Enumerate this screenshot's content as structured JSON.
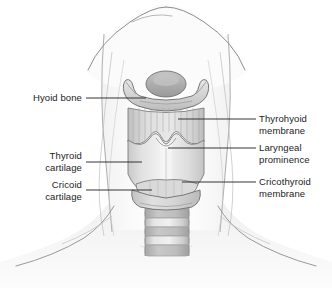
{
  "figure": {
    "background_color": "#ffffff",
    "line_color": "#2a2a2a",
    "label_text_color": "#1d1d1d"
  },
  "labels": {
    "left": [
      {
        "id": "hyoid-bone",
        "text": "Hyoid bone",
        "leader_y": 98,
        "leader_x_start": 86,
        "leader_x_end": 146
      },
      {
        "id": "thyroid-cartilage",
        "text": "Thyroid\ncartilage",
        "leader_y": 162,
        "leader_x_start": 86,
        "leader_x_end": 142
      },
      {
        "id": "cricoid-cartilage",
        "text": "Cricoid\ncartilage",
        "leader_y": 190,
        "leader_x_start": 86,
        "leader_x_end": 152
      }
    ],
    "right": [
      {
        "id": "thyrohyoid-membrane",
        "text": "Thyrohyoid\nmembrane",
        "leader_y": 119,
        "leader_x_start": 178,
        "leader_x_end": 256
      },
      {
        "id": "laryngeal-prominence",
        "text": "Laryngeal\nprominence",
        "leader_y": 148,
        "leader_x_start": 168,
        "leader_x_end": 256
      },
      {
        "id": "cricothyroid-membrane",
        "text": "Cricothyroid\nmembrane",
        "leader_y": 182,
        "leader_x_start": 182,
        "leader_x_end": 256
      }
    ]
  },
  "anatomy_parts": [
    {
      "name": "epiglottis",
      "shape": "oval",
      "fill": "#b8b8b8"
    },
    {
      "name": "hyoid-bone",
      "shape": "u-band",
      "fill": "#d8d8d8"
    },
    {
      "name": "thyrohyoid-membrane",
      "shape": "striated",
      "fill": "#d2d2d2"
    },
    {
      "name": "thyroid-cartilage",
      "shape": "shield",
      "fill": "#e4e4e4"
    },
    {
      "name": "laryngeal-prominence",
      "shape": "v-notch",
      "fill": "#efefef"
    },
    {
      "name": "cricothyroid-membrane",
      "shape": "band",
      "fill": "#dcdcdc"
    },
    {
      "name": "cricoid-cartilage",
      "shape": "ring",
      "fill": "#cfcfcf"
    },
    {
      "name": "trachea",
      "shape": "rings",
      "fill": "#d4d4d4",
      "ring_count": 6
    },
    {
      "name": "neck-silhouette",
      "shape": "outline",
      "fill": "#f6f6f6"
    },
    {
      "name": "sternocleidomastoid",
      "shape": "muscle-line",
      "fill": "none"
    }
  ]
}
